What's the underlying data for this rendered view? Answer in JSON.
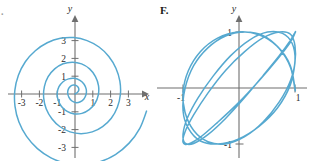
{
  "figure": {
    "background_color": "#ffffff",
    "curve_color": "#56a9d0",
    "axis_color": "#6f6f6f",
    "text_color": "#2b2b2b"
  },
  "panels": [
    {
      "key": "left",
      "label": ".",
      "axis_x_name": "x",
      "axis_y_name": "y"
    },
    {
      "key": "right",
      "label": "F.",
      "axis_x_name": "",
      "axis_y_name": "y"
    }
  ],
  "chart_data": [
    {
      "type": "line",
      "key": "left-spiral",
      "title": "",
      "subtitle": "",
      "label": ".",
      "xlabel": "x",
      "ylabel": "y",
      "xlim": [
        -3.6,
        3.6
      ],
      "ylim": [
        -3.6,
        3.6
      ],
      "grid": false,
      "legend": "none",
      "x_ticks": [
        -3,
        -2,
        -1,
        1,
        2,
        3
      ],
      "y_ticks": [
        -3,
        -2,
        -1,
        1,
        2,
        3
      ],
      "x_tick_labels": [
        "-3",
        "-2",
        "-1",
        "1",
        "2",
        "3"
      ],
      "y_tick_labels": [
        "-3",
        "-2",
        "-1",
        "1",
        "2",
        "3"
      ],
      "curve_description": "Archimedean spiral r = a*theta starting at origin, winding counterclockwise through about two and a half turns, passing y=2 on the positive y-axis, x=-2 on the negative x-axis, y=-3 near the bottom and ending just past x=3 on the right.",
      "annotations": [],
      "series": [
        {
          "name": "spiral",
          "parametric": true,
          "r_of_theta": "r = 0.30 * theta",
          "theta_range_deg": [
            0,
            760
          ],
          "points": [
            [
              0.0,
              0.0
            ],
            [
              0.13,
              0.08
            ],
            [
              0.21,
              0.21
            ],
            [
              0.19,
              0.36
            ],
            [
              0.08,
              0.47
            ],
            [
              -0.09,
              0.5
            ],
            [
              -0.26,
              0.43
            ],
            [
              -0.38,
              0.26
            ],
            [
              -0.41,
              0.04
            ],
            [
              -0.34,
              -0.19
            ],
            [
              -0.19,
              -0.38
            ],
            [
              0.03,
              -0.48
            ],
            [
              0.27,
              -0.45
            ],
            [
              0.49,
              -0.29
            ],
            [
              0.62,
              -0.03
            ],
            [
              0.63,
              0.27
            ],
            [
              0.51,
              0.55
            ],
            [
              0.28,
              0.77
            ],
            [
              -0.03,
              0.88
            ],
            [
              -0.36,
              0.85
            ],
            [
              -0.67,
              0.69
            ],
            [
              -0.9,
              0.41
            ],
            [
              -1.0,
              0.05
            ],
            [
              -0.95,
              -0.34
            ],
            [
              -0.76,
              -0.7
            ],
            [
              -0.44,
              -0.98
            ],
            [
              -0.04,
              -1.12
            ],
            [
              0.39,
              -1.09
            ],
            [
              0.8,
              -0.88
            ],
            [
              1.13,
              -0.52
            ],
            [
              1.31,
              -0.05
            ],
            [
              1.32,
              0.47
            ],
            [
              1.15,
              0.98
            ],
            [
              0.82,
              1.41
            ],
            [
              0.37,
              1.69
            ],
            [
              -0.14,
              1.79
            ],
            [
              -0.67,
              1.7
            ],
            [
              -1.14,
              1.41
            ],
            [
              -1.51,
              0.97
            ],
            [
              -1.72,
              0.41
            ],
            [
              -1.76,
              -0.21
            ],
            [
              -1.62,
              -0.83
            ],
            [
              -1.3,
              -1.39
            ],
            [
              -0.84,
              -1.84
            ],
            [
              -0.28,
              -2.13
            ],
            [
              0.34,
              -2.23
            ],
            [
              0.97,
              -2.13
            ],
            [
              1.55,
              -1.83
            ],
            [
              2.04,
              -1.36
            ],
            [
              2.38,
              -0.74
            ],
            [
              2.55,
              -0.03
            ],
            [
              2.52,
              0.72
            ],
            [
              2.3,
              1.45
            ],
            [
              1.9,
              2.11
            ],
            [
              1.35,
              2.64
            ],
            [
              0.68,
              3.0
            ],
            [
              -0.06,
              3.17
            ],
            [
              -0.82,
              3.13
            ],
            [
              -1.56,
              2.88
            ],
            [
              -2.23,
              2.43
            ],
            [
              -2.79,
              1.81
            ],
            [
              -3.18,
              1.05
            ],
            [
              -3.38,
              0.2
            ],
            [
              -3.37,
              -0.69
            ],
            [
              -3.15,
              -1.57
            ],
            [
              -2.72,
              -2.38
            ],
            [
              -2.11,
              -3.07
            ],
            [
              -1.35,
              -3.59
            ],
            [
              -0.48,
              -3.9
            ],
            [
              0.45,
              -3.98
            ],
            [
              1.39,
              -3.81
            ],
            [
              2.27,
              -3.4
            ],
            [
              3.04,
              -2.76
            ],
            [
              3.64,
              -1.93
            ],
            [
              4.02,
              -0.96
            ]
          ]
        }
      ]
    },
    {
      "type": "line",
      "key": "right-lissajous",
      "title": "",
      "subtitle": "",
      "label": "F.",
      "xlabel": "",
      "ylabel": "y",
      "xlim": [
        -1.35,
        1.35
      ],
      "ylim": [
        -1.35,
        1.35
      ],
      "grid": false,
      "legend": "none",
      "x_ticks": [
        -1,
        1
      ],
      "y_ticks": [
        -1,
        1
      ],
      "x_tick_labels": [
        "-1",
        "1"
      ],
      "y_tick_labels": [
        "-1",
        "1"
      ],
      "curve_description": "Lissajous figure x = sin(3t), y = cos(2t) style closed curve forming three tall lobes across the window, crossing the x-axis at two points and touching y = 1 at the top and y = -1 at the bottom.",
      "annotations": [],
      "series": [
        {
          "name": "lissajous",
          "parametric": true,
          "equations": "x = cos(3t), y = sin(2t)",
          "t_range_deg": [
            0,
            360
          ],
          "points": [
            [
              1.0,
              0.0
            ],
            [
              0.914,
              0.407
            ],
            [
              0.685,
              0.743
            ],
            [
              0.357,
              0.951
            ],
            [
              -0.017,
              1.0
            ],
            [
              -0.383,
              0.891
            ],
            [
              -0.691,
              0.649
            ],
            [
              -0.905,
              0.309
            ],
            [
              -0.999,
              -0.07
            ],
            [
              -0.964,
              -0.434
            ],
            [
              -0.809,
              -0.76
            ],
            [
              -0.555,
              -0.959
            ],
            [
              -0.239,
              -0.998
            ],
            [
              0.102,
              -0.869
            ],
            [
              0.434,
              -0.602
            ],
            [
              0.719,
              -0.249
            ],
            [
              0.92,
              0.134
            ],
            [
              1.0,
              0.492
            ],
            [
              0.95,
              0.795
            ],
            [
              0.777,
              0.975
            ],
            [
              0.509,
              0.998
            ],
            [
              0.187,
              0.857
            ],
            [
              -0.148,
              0.578
            ],
            [
              -0.462,
              0.212
            ],
            [
              -0.734,
              -0.18
            ],
            [
              -0.922,
              -0.536
            ],
            [
              -1.0,
              -0.825
            ],
            [
              -0.963,
              -0.985
            ],
            [
              -0.809,
              -0.99
            ],
            [
              -0.556,
              -0.833
            ],
            [
              -0.24,
              -0.543
            ],
            [
              0.101,
              -0.17
            ],
            [
              0.433,
              0.225
            ],
            [
              0.718,
              0.575
            ],
            [
              0.92,
              0.853
            ],
            [
              1.0,
              0.995
            ],
            [
              0.999,
              0.979
            ],
            [
              0.914,
              0.81
            ],
            [
              0.686,
              0.513
            ],
            [
              0.358,
              0.13
            ],
            [
              -0.016,
              -0.27
            ],
            [
              -0.382,
              -0.613
            ],
            [
              -0.69,
              -0.879
            ],
            [
              -0.904,
              -1.0
            ],
            [
              -0.999,
              -0.971
            ],
            [
              -0.964,
              -0.784
            ],
            [
              -0.81,
              -0.482
            ],
            [
              -0.556,
              -0.091
            ],
            [
              -0.24,
              0.314
            ],
            [
              0.101,
              0.649
            ],
            [
              0.433,
              0.898
            ],
            [
              0.718,
              1.0
            ],
            [
              0.92,
              0.96
            ],
            [
              1.0,
              0.754
            ],
            [
              0.999,
              0.45
            ],
            [
              0.915,
              0.051
            ],
            [
              0.686,
              -0.357
            ],
            [
              0.358,
              -0.684
            ],
            [
              -0.015,
              -0.914
            ],
            [
              -0.381,
              -1.0
            ],
            [
              -0.689,
              -0.947
            ],
            [
              -0.904,
              -0.722
            ],
            [
              -0.999,
              -0.41
            ],
            [
              -0.964,
              -0.011
            ],
            [
              -0.81,
              0.398
            ],
            [
              -0.556,
              0.717
            ],
            [
              -0.24,
              0.929
            ],
            [
              0.101,
              0.999
            ],
            [
              0.433,
              0.934
            ],
            [
              0.718,
              0.705
            ],
            [
              0.92,
              0.368
            ],
            [
              1.0,
              -0.03
            ],
            [
              1.0,
              0.0
            ]
          ]
        }
      ]
    }
  ]
}
